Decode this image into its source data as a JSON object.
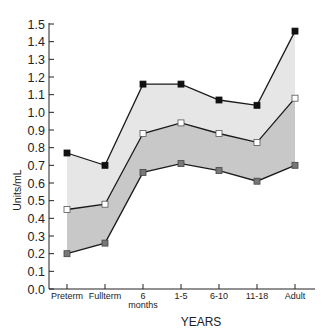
{
  "chart_data": {
    "type": "area",
    "title": "",
    "xlabel": "YEARS",
    "ylabel": "Units/mL",
    "ylim": [
      0.0,
      1.5
    ],
    "yticks": [
      "0.0",
      "0.1",
      "0.2",
      "0.3",
      "0.4",
      "0.5",
      "0.6",
      "0.7",
      "0.8",
      "0.9",
      "1.0",
      "1.1",
      "1.2",
      "1.3",
      "1.4",
      "1.5"
    ],
    "categories": [
      "Preterm",
      "Fullterm",
      "6 months",
      "1-5",
      "6-10",
      "11-18",
      "Adult"
    ],
    "category_lines": [
      [
        "Preterm"
      ],
      [
        "Fullterm"
      ],
      [
        "6",
        "months"
      ],
      [
        "1-5"
      ],
      [
        "6-10"
      ],
      [
        "11-18"
      ],
      [
        "Adult"
      ]
    ],
    "grid": false,
    "legend": "none",
    "series": [
      {
        "name": "upper",
        "marker": "filled-black-square",
        "values": [
          0.77,
          0.7,
          1.16,
          1.16,
          1.07,
          1.04,
          1.46
        ]
      },
      {
        "name": "mean",
        "marker": "open-white-square",
        "values": [
          0.45,
          0.48,
          0.88,
          0.94,
          0.88,
          0.83,
          1.08
        ]
      },
      {
        "name": "lower",
        "marker": "filled-grey-square",
        "values": [
          0.2,
          0.26,
          0.66,
          0.71,
          0.67,
          0.61,
          0.7
        ]
      }
    ],
    "fills": {
      "upper_band": "#e6e6e6",
      "lower_band": "#c8c8c8"
    }
  }
}
